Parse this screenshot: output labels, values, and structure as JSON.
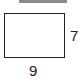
{
  "diagram": {
    "shape": "rectangle",
    "height_label": "7",
    "width_label": "9",
    "colors": {
      "stroke": "#222222",
      "top_bar": "#8a8a8a"
    }
  }
}
